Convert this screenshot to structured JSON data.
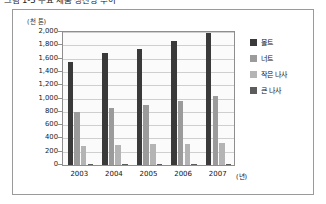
{
  "caption": "그림 1-3  주요 제품 생산량 추이",
  "frame": {
    "border_color": "#9a9a9a"
  },
  "chart_data": {
    "type": "bar",
    "title": "",
    "subtitle": "",
    "unit_label": "(천 톤)",
    "xlabel": "(년)",
    "ylabel": "",
    "categories": [
      "2003",
      "2004",
      "2005",
      "2006",
      "2007"
    ],
    "ytick_labels": [
      "2,000",
      "1,800",
      "1,600",
      "1,400",
      "1,200",
      "1,000",
      "800",
      "600",
      "400",
      "200",
      "0"
    ],
    "yticks": [
      2000,
      1800,
      1600,
      1400,
      1200,
      1000,
      800,
      600,
      400,
      200,
      0
    ],
    "ylim": [
      0,
      2000
    ],
    "grid": true,
    "legend_position": "right",
    "series": [
      {
        "name": "볼트",
        "color": "#3a3a3a",
        "values": [
          1550,
          1680,
          1750,
          1870,
          1990
        ]
      },
      {
        "name": "너트",
        "color": "#9b9b9b",
        "values": [
          800,
          860,
          910,
          960,
          1040
        ]
      },
      {
        "name": "작은 나사",
        "color": "#b4b4b4",
        "values": [
          290,
          295,
          310,
          310,
          330
        ]
      },
      {
        "name": "큰 나사",
        "color": "#5c5c5c",
        "values": [
          15,
          15,
          18,
          20,
          22
        ]
      }
    ]
  }
}
